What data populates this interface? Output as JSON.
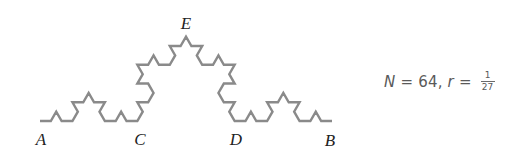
{
  "figure": {
    "curve": {
      "type": "koch-curve",
      "iterations": 3,
      "stroke_color": "#8a8a8a",
      "stroke_width": 2.4,
      "start": [
        40,
        121
      ],
      "end": [
        332,
        121
      ]
    },
    "points": [
      {
        "id": "A",
        "label": "A",
        "x": 41,
        "y": 131
      },
      {
        "id": "C",
        "label": "C",
        "x": 140,
        "y": 131
      },
      {
        "id": "D",
        "label": "D",
        "x": 236,
        "y": 131
      },
      {
        "id": "B",
        "label": "B",
        "x": 330,
        "y": 132
      },
      {
        "id": "E",
        "label": "E",
        "x": 186,
        "y": 15
      }
    ]
  },
  "equation": {
    "n_var": "N",
    "equals1": " = ",
    "n_value": "64,",
    "r_var": "r",
    "equals2": " = ",
    "r_numerator": "1",
    "r_denominator": "27"
  }
}
